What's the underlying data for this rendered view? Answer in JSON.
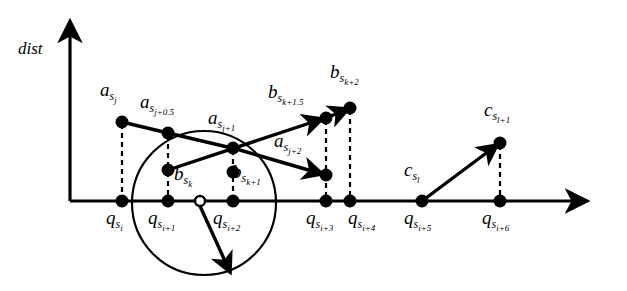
{
  "figure": {
    "kind": "diagram",
    "background_color": "#ffffff",
    "stroke_color": "#000000",
    "width": 627,
    "height": 291
  },
  "axes": {
    "y_axis_label": "dist",
    "y_axis": {
      "x": 70,
      "y_top": 18,
      "y_bottom": 201,
      "arrow": "up"
    },
    "x_axis": {
      "y": 201,
      "x_left": 70,
      "x_right": 592,
      "arrow": "right"
    }
  },
  "query_points": [
    {
      "id": "q-si",
      "base": "q",
      "sub": "s",
      "subsub": "i",
      "x": 122,
      "y": 201,
      "label_x": 106,
      "label_y": 208
    },
    {
      "id": "q-si1",
      "base": "q",
      "sub": "s",
      "subsub": "i+1",
      "x": 168,
      "y": 201,
      "label_x": 148,
      "label_y": 208
    },
    {
      "id": "q-si2",
      "base": "q",
      "sub": "s",
      "subsub": "i+2",
      "x": 233,
      "y": 201,
      "label_x": 213,
      "label_y": 208
    },
    {
      "id": "q-si3",
      "base": "q",
      "sub": "s",
      "subsub": "i+3",
      "x": 326,
      "y": 201,
      "label_x": 306,
      "label_y": 208
    },
    {
      "id": "q-si4",
      "base": "q",
      "sub": "s",
      "subsub": "i+4",
      "x": 350,
      "y": 201,
      "label_x": 348,
      "label_y": 208
    },
    {
      "id": "q-si5",
      "base": "q",
      "sub": "s",
      "subsub": "i+5",
      "x": 422,
      "y": 201,
      "label_x": 404,
      "label_y": 208
    },
    {
      "id": "q-si6",
      "base": "q",
      "sub": "s",
      "subsub": "i+6",
      "x": 500,
      "y": 201,
      "label_x": 482,
      "label_y": 208
    }
  ],
  "hollow_marker": {
    "id": "marker-open-circle",
    "x": 200,
    "y": 201,
    "radius": 5
  },
  "circle": {
    "id": "neighborhood-circle",
    "cx": 204,
    "cy": 203,
    "r": 72
  },
  "data_points": [
    {
      "id": "a-sj",
      "base": "a",
      "sub": "s",
      "subsub": "j",
      "x": 122,
      "y": 122,
      "label_x": 100,
      "label_y": 80
    },
    {
      "id": "a-sj05",
      "base": "a",
      "sub": "s",
      "subsub": "j+0.5",
      "x": 168,
      "y": 133,
      "label_x": 140,
      "label_y": 92
    },
    {
      "id": "a-sj1",
      "base": "a",
      "sub": "s",
      "subsub": "j+1",
      "x": 233,
      "y": 148,
      "label_x": 208,
      "label_y": 108
    },
    {
      "id": "a-sj2",
      "base": "a",
      "sub": "s",
      "subsub": "j+2",
      "x": 326,
      "y": 175,
      "label_x": 274,
      "label_y": 131
    },
    {
      "id": "b-sk",
      "base": "b",
      "sub": "s",
      "subsub": "k",
      "x": 168,
      "y": 170,
      "label_x": 172,
      "label_y": 165
    },
    {
      "id": "b-sk1",
      "base": "b",
      "sub": "s",
      "subsub": "k+1",
      "x": 233,
      "y": 172,
      "label_x": 230,
      "label_y": 163
    },
    {
      "id": "b-sk15",
      "base": "b",
      "sub": "s",
      "subsub": "k+1.5",
      "x": 326,
      "y": 118,
      "label_x": 270,
      "label_y": 83
    },
    {
      "id": "b-sk2",
      "base": "b",
      "sub": "s",
      "subsub": "k+2",
      "x": 350,
      "y": 108,
      "label_x": 330,
      "label_y": 64
    },
    {
      "id": "c-sl",
      "base": "c",
      "sub": "s",
      "subsub": "l",
      "x": 422,
      "y": 201,
      "label_x": 406,
      "label_y": 160
    },
    {
      "id": "c-sl1",
      "base": "c",
      "sub": "s",
      "subsub": "l+1",
      "x": 500,
      "y": 143,
      "label_x": 484,
      "label_y": 100
    }
  ],
  "solid_segments": [
    {
      "id": "seg-asj-to-asj05",
      "x1": 122,
      "y1": 122,
      "x2": 168,
      "y2": 133
    },
    {
      "id": "seg-asj05-to-asj1",
      "x1": 168,
      "y1": 133,
      "x2": 233,
      "y2": 148
    }
  ],
  "arrows": [
    {
      "id": "arrow-bsk-to-bsk15",
      "x1": 168,
      "y1": 170,
      "x2": 326,
      "y2": 118
    },
    {
      "id": "arrow-bsk15-to-bsk2",
      "x1": 326,
      "y1": 118,
      "x2": 350,
      "y2": 108
    },
    {
      "id": "arrow-asj1-to-asj2",
      "x1": 233,
      "y1": 148,
      "x2": 326,
      "y2": 175
    },
    {
      "id": "arrow-csl-to-csl1",
      "x1": 422,
      "y1": 201,
      "x2": 500,
      "y2": 143
    },
    {
      "id": "arrow-open-marker-down",
      "x1": 200,
      "y1": 204,
      "x2": 232,
      "y2": 276
    }
  ],
  "dashed_connectors": [
    {
      "id": "dash-asj",
      "x": 122,
      "y1": 122,
      "y2": 201
    },
    {
      "id": "dash-asj05",
      "x": 168,
      "y1": 133,
      "y2": 170
    },
    {
      "id": "dash-bsk",
      "x": 168,
      "y1": 170,
      "y2": 201
    },
    {
      "id": "dash-bsk1",
      "x": 233,
      "y1": 148,
      "y2": 201
    },
    {
      "id": "dash-asj2",
      "x": 326,
      "y1": 118,
      "y2": 201
    },
    {
      "id": "dash-bsk2",
      "x": 350,
      "y1": 108,
      "y2": 201
    },
    {
      "id": "dash-csl1",
      "x": 500,
      "y1": 143,
      "y2": 201
    }
  ]
}
